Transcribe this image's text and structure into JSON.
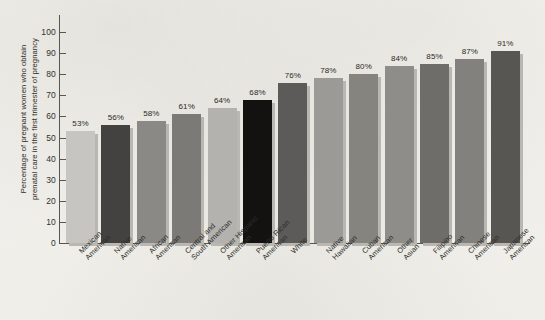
{
  "chart_data": {
    "type": "bar",
    "title": "",
    "subtitle": "",
    "xlabel": "",
    "ylabel_lines": [
      "Percentage of pregnant women who obtain",
      "prenatal care in the first trimester of pregnancy"
    ],
    "ylabel": "Percentage of pregnant women who obtain prenatal care in the first trimester of pregnancy",
    "ylim": [
      0,
      100
    ],
    "y_ticks": [
      0,
      10,
      20,
      30,
      40,
      50,
      60,
      70,
      80,
      90,
      100
    ],
    "y_tick_labels": [
      "0",
      "10",
      "20",
      "30",
      "40",
      "50",
      "60",
      "70",
      "80",
      "90",
      "100"
    ],
    "grid": false,
    "legend": false,
    "value_label_suffix": "%",
    "categories": [
      "Mexican American",
      "Native American",
      "African American",
      "Central and South American",
      "Other Hispanic American",
      "Puerto Rican American",
      "White",
      "Native Hawaiian",
      "Cuban American",
      "Other Asian",
      "Filipino American",
      "Chinese American",
      "Japanese American"
    ],
    "category_lines": [
      [
        "Mexican",
        "American"
      ],
      [
        "Native",
        "American"
      ],
      [
        "African",
        "American"
      ],
      [
        "Central and",
        "South American"
      ],
      [
        "Other Hispanic",
        "American"
      ],
      [
        "Puerto Rican",
        "American"
      ],
      [
        "White",
        ""
      ],
      [
        "Native",
        "Hawaiian"
      ],
      [
        "Cuban",
        "American"
      ],
      [
        "Other",
        "Asian"
      ],
      [
        "Filipino",
        "American"
      ],
      [
        "Chinese",
        "American"
      ],
      [
        "Japanese",
        "American"
      ]
    ],
    "values": [
      53,
      56,
      58,
      61,
      64,
      68,
      76,
      78,
      80,
      84,
      85,
      87,
      91
    ],
    "value_labels": [
      "53%",
      "56%",
      "58%",
      "61%",
      "64%",
      "68%",
      "76%",
      "78%",
      "80%",
      "84%",
      "85%",
      "87%",
      "91%"
    ],
    "bar_colors": [
      "#c6c5c1",
      "#434240",
      "#8a8986",
      "#7b7a77",
      "#b3b2ae",
      "#131211",
      "#5c5b59",
      "#9b9a97",
      "#85847f",
      "#8e8d89",
      "#6e6d6a",
      "#82817d",
      "#575653"
    ],
    "shadow_color": "#b9b7b1",
    "axis_color": "#595650",
    "background_color": "#f4f3ef",
    "text_color": "#2f2d29"
  }
}
